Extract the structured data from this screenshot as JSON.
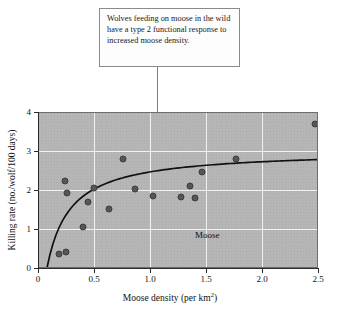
{
  "callout": {
    "text": "Wolves feeding on moose in the wild have a type 2 functional response to increased moose density."
  },
  "annotation": {
    "in_plot_label": "Moose"
  },
  "colors": {
    "plot_background": "#b6b6b6",
    "gridline": "#f2f2f2",
    "point_fill": "#565656",
    "curve": "#111111",
    "axis": "#2b2b2b",
    "callout_border": "#8a8a8a",
    "page_background": "#ffffff"
  },
  "chart_data": {
    "type": "scatter",
    "title": "",
    "xlabel": "Moose density (per km²)",
    "ylabel": "Killing rate (no./wolf/100 days)",
    "xlim": [
      0,
      2.5
    ],
    "ylim": [
      0,
      4
    ],
    "xticks": [
      0,
      0.5,
      1.0,
      1.5,
      2.0,
      2.5
    ],
    "xticklabels": [
      "0",
      "0.5",
      "1.0",
      "1.5",
      "2.0",
      "2.5"
    ],
    "yticks": [
      0,
      1,
      2,
      3,
      4
    ],
    "yticklabels": [
      "0",
      "1",
      "2",
      "3",
      "4"
    ],
    "grid": true,
    "legend": "none",
    "points": [
      {
        "x": 0.19,
        "y": 0.35
      },
      {
        "x": 0.25,
        "y": 0.42
      },
      {
        "x": 0.24,
        "y": 2.22
      },
      {
        "x": 0.26,
        "y": 1.92
      },
      {
        "x": 0.4,
        "y": 1.05
      },
      {
        "x": 0.45,
        "y": 1.7
      },
      {
        "x": 0.5,
        "y": 2.05
      },
      {
        "x": 0.63,
        "y": 1.52
      },
      {
        "x": 0.76,
        "y": 2.8
      },
      {
        "x": 0.87,
        "y": 2.02
      },
      {
        "x": 1.03,
        "y": 1.85
      },
      {
        "x": 1.28,
        "y": 1.83
      },
      {
        "x": 1.36,
        "y": 2.1
      },
      {
        "x": 1.4,
        "y": 1.8
      },
      {
        "x": 1.46,
        "y": 2.45
      },
      {
        "x": 1.77,
        "y": 2.8
      },
      {
        "x": 2.47,
        "y": 3.7
      }
    ],
    "fitted_curve": {
      "model": "type 2 functional response (Holling disc equation)",
      "equation": "y = a*x / (1 + a*h*x)",
      "x_start": 0.08,
      "x_end": 2.5,
      "y_start": 0.0,
      "y_end": 2.78
    }
  }
}
